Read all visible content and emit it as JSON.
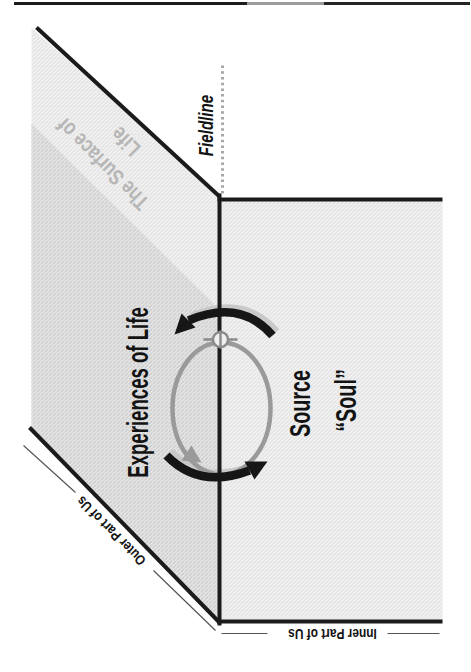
{
  "figure": {
    "labels": {
      "fieldline": "Fieldline",
      "surface_line1": "The Surface of",
      "surface_line2": "Life",
      "experiences": "Experiences of Life",
      "source": "Source",
      "soul": "“Soul”",
      "outer": "Outer Part of Us",
      "inner": "Inner Part of Us"
    },
    "colors": {
      "main_line": "#1b1b1b",
      "gray_cycle": "#9a9a9a",
      "halo": "#c9c9c9",
      "surface_text": "#b6b6b6",
      "dotted_line": "#a8a8a8",
      "hatch_light_bg": "#f6f6f6",
      "hatch_light_line": "#d7d7d7",
      "hatch_dark_bg": "#eeeeee",
      "hatch_dark_line": "#c2c2c2"
    },
    "icons": [
      "crossed-circle-marker-icon",
      "cycle-arrow-out-icon",
      "cycle-arrow-in-icon",
      "ellipse-arrowhead-icon"
    ]
  }
}
